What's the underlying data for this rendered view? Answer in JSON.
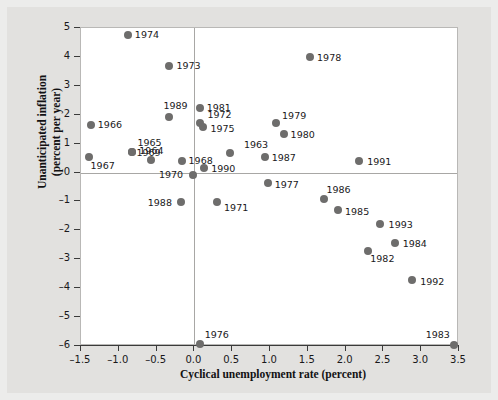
{
  "chart_data": {
    "type": "scatter",
    "title": "",
    "xlabel": "Cyclical unemployment rate (percent)",
    "ylabel_line1": "Unanticipated inflation",
    "ylabel_line2": "(percent per year)",
    "xlim": [
      -1.5,
      3.5
    ],
    "ylim": [
      -6,
      5
    ],
    "xticks": [
      "-1.5",
      "-1.0",
      "-0.5",
      "0.0",
      "0.5",
      "1.0",
      "1.5",
      "2.0",
      "2.5",
      "3.0",
      "3.5"
    ],
    "xtick_values": [
      -1.5,
      -1.0,
      -0.5,
      0.0,
      0.5,
      1.0,
      1.5,
      2.0,
      2.5,
      3.0,
      3.5
    ],
    "yticks": [
      "5",
      "4",
      "3",
      "2",
      "1",
      "0",
      "-1",
      "-2",
      "-3",
      "-4",
      "-5",
      "-6"
    ],
    "ytick_values": [
      5,
      4,
      3,
      2,
      1,
      0,
      -1,
      -2,
      -3,
      -4,
      -5,
      -6
    ],
    "grid": false,
    "legend": false,
    "zero_lines": {
      "x": 0.0,
      "y": 0.0
    },
    "point_color": "#6e6d6c",
    "plot_background": "#ffffff",
    "figure_background": "#e2e1df",
    "points": [
      {
        "label": "1963",
        "x": 0.47,
        "y": 0.68,
        "lx": 14,
        "ly": -13
      },
      {
        "label": "1964",
        "x": -0.57,
        "y": 0.42,
        "lx": -12,
        "ly": -14
      },
      {
        "label": "1965",
        "x": -0.82,
        "y": 0.72,
        "lx": 5,
        "ly": -14
      },
      {
        "label": "1966",
        "x": -1.37,
        "y": 1.65,
        "lx": 7,
        "ly": -5
      },
      {
        "label": "1967",
        "x": -1.4,
        "y": 0.55,
        "lx": 2,
        "ly": 4
      },
      {
        "label": "1968",
        "x": -0.17,
        "y": 0.4,
        "lx": 7,
        "ly": -5
      },
      {
        "label": "1969",
        "x": -0.82,
        "y": 0.72,
        "lx": 4,
        "ly": -4
      },
      {
        "label": "1970",
        "x": -0.02,
        "y": -0.1,
        "lx": -34,
        "ly": -5
      },
      {
        "label": "1971",
        "x": 0.3,
        "y": -1.02,
        "lx": 7,
        "ly": 1
      },
      {
        "label": "1972",
        "x": 0.08,
        "y": 1.7,
        "lx": 7,
        "ly": -13
      },
      {
        "label": "1973",
        "x": -0.33,
        "y": 3.7,
        "lx": 7,
        "ly": -5
      },
      {
        "label": "1974",
        "x": -0.88,
        "y": 4.75,
        "lx": 7,
        "ly": -5
      },
      {
        "label": "1975",
        "x": 0.12,
        "y": 1.58,
        "lx": 7,
        "ly": -3
      },
      {
        "label": "1976",
        "x": 0.07,
        "y": -5.93,
        "lx": 5,
        "ly": -14
      },
      {
        "label": "1977",
        "x": 0.97,
        "y": -0.35,
        "lx": 7,
        "ly": -3
      },
      {
        "label": "1978",
        "x": 1.53,
        "y": 4.0,
        "lx": 7,
        "ly": -4
      },
      {
        "label": "1979",
        "x": 1.08,
        "y": 1.7,
        "lx": 6,
        "ly": -12
      },
      {
        "label": "1980",
        "x": 1.18,
        "y": 1.35,
        "lx": 7,
        "ly": -4
      },
      {
        "label": "1981",
        "x": 0.07,
        "y": 2.22,
        "lx": 7,
        "ly": -5
      },
      {
        "label": "1982",
        "x": 2.3,
        "y": -2.7,
        "lx": 2,
        "ly": 3
      },
      {
        "label": "1983",
        "x": 3.43,
        "y": -5.97,
        "lx": -28,
        "ly": -15
      },
      {
        "label": "1984",
        "x": 2.65,
        "y": -2.42,
        "lx": 8,
        "ly": -4
      },
      {
        "label": "1985",
        "x": 1.9,
        "y": -1.28,
        "lx": 7,
        "ly": -3
      },
      {
        "label": "1986",
        "x": 1.72,
        "y": -0.93,
        "lx": 2,
        "ly": -14
      },
      {
        "label": "1987",
        "x": 0.93,
        "y": 0.55,
        "lx": 7,
        "ly": -4
      },
      {
        "label": "1988",
        "x": -0.18,
        "y": -1.02,
        "lx": -33,
        "ly": -4
      },
      {
        "label": "1989",
        "x": -0.33,
        "y": 1.93,
        "lx": -6,
        "ly": -16
      },
      {
        "label": "1990",
        "x": 0.13,
        "y": 0.15,
        "lx": 7,
        "ly": -4
      },
      {
        "label": "1991",
        "x": 2.18,
        "y": 0.4,
        "lx": 8,
        "ly": -4
      },
      {
        "label": "1992",
        "x": 2.88,
        "y": -3.7,
        "lx": 8,
        "ly": -3
      },
      {
        "label": "1993",
        "x": 2.45,
        "y": -1.78,
        "lx": 9,
        "ly": -4
      }
    ]
  }
}
